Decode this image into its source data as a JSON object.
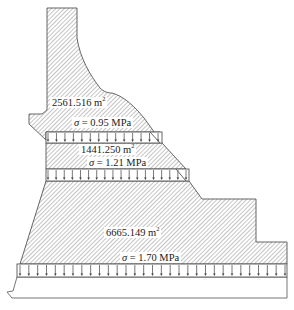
{
  "diagram": {
    "type": "dam cross-section with horizontal stress bands",
    "colors": {
      "outline": "#555555",
      "hatch": "#8a8a8a",
      "background": "#ffffff",
      "text": "#222222"
    },
    "regions": [
      {
        "id": "upper",
        "area_value": "2561.516",
        "area_unit": "m",
        "area_exp": "2"
      },
      {
        "id": "middle",
        "area_value": "1441.250",
        "area_unit": "m",
        "area_exp": "2"
      },
      {
        "id": "lower",
        "area_value": "6665.149",
        "area_unit": "m",
        "area_exp": "2"
      }
    ],
    "stress_bands": [
      {
        "id": "band-1",
        "symbol": "σ",
        "text": " = 0.95 MPa",
        "arrow_count": 14
      },
      {
        "id": "band-2",
        "symbol": "σ",
        "text": " = 1.21 MPa",
        "arrow_count": 18
      },
      {
        "id": "band-3",
        "symbol": "σ",
        "text": " = 1.70 MPa",
        "arrow_count": 31
      }
    ]
  }
}
